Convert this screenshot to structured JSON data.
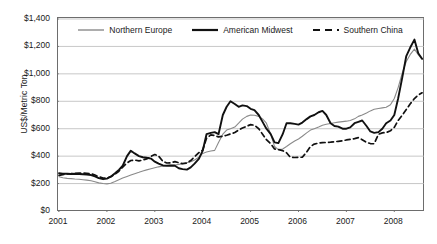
{
  "chart_data": {
    "type": "line",
    "title": "",
    "xlabel": "",
    "ylabel": "US$/Metric Ton",
    "xlim": [
      2001,
      2008.62
    ],
    "ylim": [
      0,
      1400
    ],
    "grid": true,
    "legend_position": "top-center",
    "x_tick_labels": [
      "2001",
      "2002",
      "2003",
      "2004",
      "2005",
      "2006",
      "2007",
      "2008"
    ],
    "x_tick_values": [
      2001,
      2002,
      2003,
      2004,
      2005,
      2006,
      2007,
      2008
    ],
    "y_tick_labels": [
      "$0",
      "$200",
      "$400",
      "$600",
      "$800",
      "$1,000",
      "$1,200",
      "$1,400"
    ],
    "y_tick_values": [
      0,
      200,
      400,
      600,
      800,
      1000,
      1200,
      1400
    ],
    "currency_prefix": "$",
    "series": [
      {
        "name": "Northern Europe",
        "color": "#8a8a8a",
        "style": "solid",
        "width": 1.1,
        "x": [
          2001.0,
          2001.08,
          2001.17,
          2001.25,
          2001.33,
          2001.42,
          2001.5,
          2001.58,
          2001.67,
          2001.75,
          2001.83,
          2001.92,
          2002.0,
          2002.08,
          2002.17,
          2002.25,
          2002.33,
          2002.42,
          2002.5,
          2002.58,
          2002.67,
          2002.75,
          2002.83,
          2002.92,
          2003.0,
          2003.08,
          2003.17,
          2003.25,
          2003.33,
          2003.42,
          2003.5,
          2003.58,
          2003.67,
          2003.75,
          2003.83,
          2003.92,
          2004.0,
          2004.08,
          2004.17,
          2004.25,
          2004.33,
          2004.42,
          2004.5,
          2004.58,
          2004.67,
          2004.75,
          2004.83,
          2004.92,
          2005.0,
          2005.08,
          2005.17,
          2005.25,
          2005.33,
          2005.42,
          2005.5,
          2005.58,
          2005.67,
          2005.75,
          2005.83,
          2005.92,
          2006.0,
          2006.08,
          2006.17,
          2006.25,
          2006.33,
          2006.42,
          2006.5,
          2006.58,
          2006.67,
          2006.75,
          2006.83,
          2006.92,
          2007.0,
          2007.08,
          2007.17,
          2007.25,
          2007.33,
          2007.42,
          2007.5,
          2007.58,
          2007.67,
          2007.75,
          2007.83,
          2007.92,
          2008.0,
          2008.08,
          2008.17,
          2008.25,
          2008.33,
          2008.42,
          2008.5,
          2008.58
        ],
        "values": [
          250,
          243,
          238,
          236,
          233,
          231,
          228,
          225,
          220,
          213,
          205,
          200,
          198,
          202,
          215,
          228,
          240,
          252,
          262,
          272,
          282,
          292,
          300,
          308,
          315,
          322,
          328,
          332,
          334,
          336,
          340,
          345,
          352,
          360,
          372,
          392,
          420,
          430,
          438,
          442,
          500,
          560,
          590,
          600,
          612,
          640,
          670,
          690,
          700,
          698,
          690,
          672,
          640,
          560,
          470,
          448,
          452,
          470,
          490,
          510,
          525,
          545,
          570,
          590,
          600,
          612,
          625,
          632,
          638,
          644,
          648,
          652,
          655,
          660,
          672,
          690,
          700,
          715,
          730,
          742,
          748,
          752,
          756,
          775,
          820,
          900,
          1010,
          1090,
          1140,
          1180,
          1140,
          1105
        ]
      },
      {
        "name": "American Midwest",
        "color": "#111111",
        "style": "solid",
        "width": 1.9,
        "x": [
          2001.0,
          2001.08,
          2001.17,
          2001.25,
          2001.33,
          2001.42,
          2001.5,
          2001.58,
          2001.67,
          2001.75,
          2001.83,
          2001.92,
          2002.0,
          2002.08,
          2002.17,
          2002.25,
          2002.33,
          2002.42,
          2002.5,
          2002.58,
          2002.67,
          2002.75,
          2002.83,
          2002.92,
          2003.0,
          2003.08,
          2003.17,
          2003.25,
          2003.33,
          2003.42,
          2003.5,
          2003.58,
          2003.67,
          2003.75,
          2003.83,
          2003.92,
          2004.0,
          2004.08,
          2004.17,
          2004.25,
          2004.33,
          2004.42,
          2004.5,
          2004.58,
          2004.67,
          2004.75,
          2004.83,
          2004.92,
          2005.0,
          2005.08,
          2005.17,
          2005.25,
          2005.33,
          2005.42,
          2005.5,
          2005.58,
          2005.67,
          2005.75,
          2005.83,
          2005.92,
          2006.0,
          2006.08,
          2006.17,
          2006.25,
          2006.33,
          2006.42,
          2006.5,
          2006.58,
          2006.67,
          2006.75,
          2006.83,
          2006.92,
          2007.0,
          2007.08,
          2007.17,
          2007.25,
          2007.33,
          2007.42,
          2007.5,
          2007.58,
          2007.67,
          2007.75,
          2007.83,
          2007.92,
          2008.0,
          2008.08,
          2008.17,
          2008.25,
          2008.33,
          2008.42,
          2008.5,
          2008.58
        ],
        "values": [
          275,
          272,
          272,
          270,
          272,
          270,
          268,
          265,
          262,
          252,
          240,
          232,
          236,
          250,
          275,
          300,
          330,
          400,
          440,
          420,
          400,
          392,
          388,
          382,
          360,
          345,
          332,
          330,
          332,
          330,
          312,
          305,
          302,
          318,
          345,
          380,
          440,
          560,
          570,
          575,
          560,
          700,
          760,
          800,
          780,
          760,
          770,
          765,
          745,
          735,
          700,
          650,
          600,
          560,
          500,
          495,
          560,
          640,
          640,
          635,
          630,
          645,
          670,
          690,
          700,
          720,
          730,
          700,
          640,
          620,
          615,
          600,
          600,
          610,
          640,
          650,
          660,
          620,
          580,
          570,
          575,
          600,
          640,
          660,
          700,
          820,
          980,
          1130,
          1190,
          1250,
          1150,
          1110
        ]
      },
      {
        "name": "Southern China",
        "color": "#111111",
        "style": "dashed",
        "width": 1.7,
        "x": [
          2001.0,
          2001.08,
          2001.17,
          2001.25,
          2001.33,
          2001.42,
          2001.5,
          2001.58,
          2001.67,
          2001.75,
          2001.83,
          2001.92,
          2002.0,
          2002.08,
          2002.17,
          2002.25,
          2002.33,
          2002.42,
          2002.5,
          2002.58,
          2002.67,
          2002.75,
          2002.83,
          2002.92,
          2003.0,
          2003.08,
          2003.17,
          2003.25,
          2003.33,
          2003.42,
          2003.5,
          2003.58,
          2003.67,
          2003.75,
          2003.83,
          2003.92,
          2004.0,
          2004.08,
          2004.17,
          2004.25,
          2004.33,
          2004.42,
          2004.5,
          2004.58,
          2004.67,
          2004.75,
          2004.83,
          2004.92,
          2005.0,
          2005.08,
          2005.17,
          2005.25,
          2005.33,
          2005.42,
          2005.5,
          2005.58,
          2005.67,
          2005.75,
          2005.83,
          2005.92,
          2006.0,
          2006.08,
          2006.17,
          2006.25,
          2006.33,
          2006.42,
          2006.5,
          2006.58,
          2006.67,
          2006.75,
          2006.83,
          2006.92,
          2007.0,
          2007.08,
          2007.17,
          2007.25,
          2007.33,
          2007.42,
          2007.5,
          2007.58,
          2007.67,
          2007.75,
          2007.83,
          2007.92,
          2008.0,
          2008.08,
          2008.17,
          2008.25,
          2008.33,
          2008.42,
          2008.5,
          2008.58
        ],
        "values": [
          260,
          265,
          270,
          272,
          275,
          276,
          276,
          275,
          272,
          262,
          250,
          240,
          240,
          250,
          268,
          290,
          320,
          350,
          368,
          372,
          365,
          372,
          380,
          398,
          412,
          400,
          362,
          350,
          352,
          360,
          352,
          345,
          350,
          368,
          395,
          425,
          445,
          530,
          555,
          550,
          540,
          545,
          552,
          562,
          572,
          590,
          605,
          618,
          630,
          625,
          600,
          560,
          520,
          490,
          452,
          448,
          440,
          425,
          392,
          390,
          392,
          392,
          430,
          470,
          488,
          495,
          498,
          500,
          502,
          505,
          508,
          512,
          518,
          522,
          528,
          535,
          520,
          500,
          492,
          490,
          560,
          570,
          572,
          585,
          610,
          660,
          700,
          740,
          780,
          820,
          845,
          862
        ]
      }
    ]
  },
  "axes": {
    "y_label": "US$/Metric Ton"
  }
}
